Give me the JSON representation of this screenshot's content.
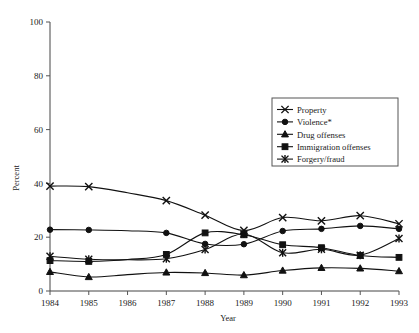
{
  "chart_data": {
    "type": "line",
    "title": "",
    "xlabel": "Year",
    "ylabel": "Percent",
    "x": [
      1984,
      1985,
      1986,
      1987,
      1988,
      1989,
      1990,
      1991,
      1992,
      1993
    ],
    "xtick_labels": [
      "1984",
      "1985",
      "1986",
      "1987",
      "1988",
      "1989",
      "1990",
      "1991",
      "1992",
      "1993"
    ],
    "ytick_labels": [
      "0",
      "20",
      "40",
      "60",
      "80",
      "100"
    ],
    "yticks": [
      0,
      20,
      40,
      60,
      80,
      100
    ],
    "ylim": [
      0,
      100
    ],
    "xlim": [
      1984,
      1993
    ],
    "grid": false,
    "legend_position": "upper right",
    "marker_years": [
      1984,
      1985,
      1987,
      1988,
      1989,
      1990,
      1991,
      1992,
      1993
    ],
    "series": [
      {
        "name": "Property",
        "marker": "cross-x",
        "values": [
          39,
          38.8,
          36.5,
          33.6,
          28.2,
          22.5,
          27.3,
          26.1,
          28.0,
          25.0
        ]
      },
      {
        "name": "Violence*",
        "marker": "filled-circle",
        "values": [
          22.8,
          22.7,
          22.4,
          21.6,
          17.5,
          17.4,
          22.3,
          23.1,
          24.2,
          23.1
        ]
      },
      {
        "name": "Drug offenses",
        "marker": "filled-triangle",
        "values": [
          7.1,
          5.2,
          6.1,
          6.9,
          6.7,
          5.9,
          7.6,
          8.6,
          8.4,
          7.4
        ]
      },
      {
        "name": "Immigration offenses",
        "marker": "filled-square",
        "values": [
          11.3,
          11.0,
          11.7,
          13.6,
          21.6,
          20.9,
          17.2,
          16.1,
          13.2,
          12.5
        ]
      },
      {
        "name": "Forgery/fraud",
        "marker": "asterisk",
        "values": [
          12.9,
          11.8,
          11.6,
          12.0,
          15.4,
          21.2,
          14.2,
          15.5,
          13.3,
          19.5
        ]
      }
    ]
  },
  "legend": {
    "entries": [
      {
        "label": "Property",
        "marker": "cross-x"
      },
      {
        "label": "Violence*",
        "marker": "filled-circle"
      },
      {
        "label": "Drug offenses",
        "marker": "filled-triangle"
      },
      {
        "label": "Immigration offenses",
        "marker": "filled-square"
      },
      {
        "label": "Forgery/fraud",
        "marker": "asterisk"
      }
    ]
  },
  "axes": {
    "x_title": "Year",
    "y_title": "Percent"
  },
  "colors": {
    "ink": "#111111",
    "axis": "#444444",
    "background": "#ffffff"
  }
}
